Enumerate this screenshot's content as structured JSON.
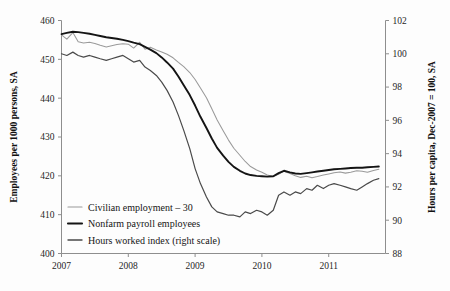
{
  "chart_data": {
    "type": "line",
    "title": "",
    "subtitle": "",
    "xlabel": "",
    "ylabel": "Employees per 1000 persons, SA",
    "y2label": "Hours per capita, Dec-2007 = 100, SA",
    "grid": false,
    "legend_position": "inside-bottom-left",
    "xlim": [
      2007.0,
      2011.85
    ],
    "ylim": [
      400,
      460
    ],
    "y2lim": [
      88,
      102
    ],
    "xticks": [
      "2007",
      "2008",
      "2009",
      "2010",
      "2011"
    ],
    "xtick_values": [
      2007,
      2008,
      2009,
      2010,
      2011
    ],
    "yticks": [
      "400",
      "410",
      "420",
      "430",
      "440",
      "450",
      "460"
    ],
    "ytick_values": [
      400,
      410,
      420,
      430,
      440,
      450,
      460
    ],
    "y2ticks": [
      "88",
      "90",
      "92",
      "94",
      "96",
      "98",
      "100",
      "102"
    ],
    "y2tick_values": [
      88,
      90,
      92,
      94,
      96,
      98,
      100,
      102
    ],
    "series": [
      {
        "name": "Civilian employment – 30",
        "axis": "left",
        "color": "#9a9a9a",
        "x": [
          2007.0,
          2007.08,
          2007.17,
          2007.25,
          2007.33,
          2007.42,
          2007.5,
          2007.58,
          2007.67,
          2007.75,
          2007.83,
          2007.92,
          2008.0,
          2008.08,
          2008.17,
          2008.25,
          2008.33,
          2008.42,
          2008.5,
          2008.58,
          2008.67,
          2008.75,
          2008.83,
          2008.92,
          2009.0,
          2009.08,
          2009.17,
          2009.25,
          2009.33,
          2009.42,
          2009.5,
          2009.58,
          2009.67,
          2009.75,
          2009.83,
          2009.92,
          2010.0,
          2010.08,
          2010.17,
          2010.25,
          2010.33,
          2010.42,
          2010.5,
          2010.58,
          2010.67,
          2010.75,
          2010.83,
          2010.92,
          2011.0,
          2011.08,
          2011.17,
          2011.25,
          2011.33,
          2011.42,
          2011.5,
          2011.58,
          2011.67,
          2011.75
        ],
        "y": [
          456.3,
          455.2,
          456.9,
          454.5,
          454.2,
          454.4,
          454.1,
          453.6,
          453.2,
          453.5,
          453.8,
          454.0,
          453.9,
          452.9,
          454.4,
          452.6,
          453.1,
          452.4,
          451.9,
          451.3,
          450.4,
          449.2,
          448.1,
          446.6,
          444.8,
          442.6,
          440.1,
          437.3,
          434.4,
          431.6,
          429.2,
          427.1,
          425.3,
          423.7,
          422.4,
          421.5,
          420.9,
          420.2,
          419.8,
          420.4,
          421.2,
          420.6,
          420.0,
          419.6,
          419.9,
          419.5,
          419.8,
          420.2,
          420.5,
          420.8,
          421.0,
          420.7,
          420.9,
          421.3,
          421.2,
          420.9,
          421.4,
          421.7
        ]
      },
      {
        "name": "Nonfarm payroll employees",
        "axis": "left",
        "color": "#141414",
        "x": [
          2007.0,
          2007.08,
          2007.17,
          2007.25,
          2007.33,
          2007.42,
          2007.5,
          2007.58,
          2007.67,
          2007.75,
          2007.83,
          2007.92,
          2008.0,
          2008.08,
          2008.17,
          2008.25,
          2008.33,
          2008.42,
          2008.5,
          2008.58,
          2008.67,
          2008.75,
          2008.83,
          2008.92,
          2009.0,
          2009.08,
          2009.17,
          2009.25,
          2009.33,
          2009.42,
          2009.5,
          2009.58,
          2009.67,
          2009.75,
          2009.83,
          2009.92,
          2010.0,
          2010.08,
          2010.17,
          2010.25,
          2010.33,
          2010.42,
          2010.5,
          2010.58,
          2010.67,
          2010.75,
          2010.83,
          2010.92,
          2011.0,
          2011.08,
          2011.17,
          2011.25,
          2011.33,
          2011.42,
          2011.5,
          2011.58,
          2011.67,
          2011.75
        ],
        "y": [
          456.5,
          456.8,
          457.1,
          457.0,
          456.8,
          456.6,
          456.3,
          456.0,
          455.7,
          455.5,
          455.3,
          455.0,
          454.7,
          454.3,
          453.9,
          453.2,
          452.5,
          451.6,
          450.5,
          449.2,
          447.6,
          445.6,
          443.3,
          440.8,
          438.1,
          435.2,
          432.3,
          429.6,
          427.2,
          425.2,
          423.6,
          422.3,
          421.3,
          420.6,
          420.2,
          420.0,
          419.9,
          419.8,
          419.9,
          420.7,
          421.3,
          420.9,
          420.6,
          420.5,
          420.7,
          420.9,
          421.1,
          421.3,
          421.5,
          421.7,
          421.8,
          421.9,
          422.0,
          422.1,
          422.1,
          422.2,
          422.3,
          422.4
        ]
      },
      {
        "name": "Hours worked index (right scale)",
        "axis": "right",
        "color": "#4a4a4a",
        "x": [
          2007.0,
          2007.08,
          2007.17,
          2007.25,
          2007.33,
          2007.42,
          2007.5,
          2007.58,
          2007.67,
          2007.75,
          2007.83,
          2007.92,
          2008.0,
          2008.08,
          2008.17,
          2008.25,
          2008.33,
          2008.42,
          2008.5,
          2008.58,
          2008.67,
          2008.75,
          2008.83,
          2008.92,
          2009.0,
          2009.08,
          2009.17,
          2009.25,
          2009.33,
          2009.42,
          2009.5,
          2009.58,
          2009.67,
          2009.75,
          2009.83,
          2009.92,
          2010.0,
          2010.08,
          2010.17,
          2010.25,
          2010.33,
          2010.42,
          2010.5,
          2010.58,
          2010.67,
          2010.75,
          2010.83,
          2010.92,
          2011.0,
          2011.08,
          2011.17,
          2011.25,
          2011.33,
          2011.42,
          2011.5,
          2011.58,
          2011.67,
          2011.75
        ],
        "y": [
          100.0,
          99.9,
          100.1,
          99.9,
          99.8,
          99.9,
          99.8,
          99.7,
          99.6,
          99.7,
          99.8,
          99.9,
          99.7,
          99.5,
          99.6,
          99.2,
          99.0,
          98.7,
          98.3,
          97.8,
          97.1,
          96.3,
          95.4,
          94.3,
          93.1,
          92.2,
          91.4,
          90.8,
          90.5,
          90.4,
          90.3,
          90.3,
          90.2,
          90.5,
          90.4,
          90.6,
          90.5,
          90.3,
          90.6,
          91.5,
          91.7,
          91.5,
          91.7,
          91.6,
          91.9,
          91.8,
          92.1,
          91.9,
          92.1,
          92.2,
          92.1,
          92.0,
          91.9,
          91.8,
          92.0,
          92.2,
          92.4,
          92.5
        ]
      }
    ],
    "legend": [
      {
        "label": "Civilian employment – 30",
        "color": "#9a9a9a",
        "weight": "thin"
      },
      {
        "label": "Nonfarm payroll employees",
        "color": "#141414",
        "weight": "thick"
      },
      {
        "label": "Hours worked index (right scale)",
        "color": "#4a4a4a",
        "weight": "medium"
      }
    ]
  }
}
